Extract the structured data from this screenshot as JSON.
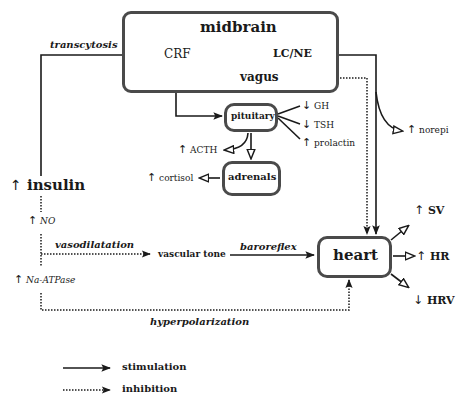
{
  "diagram": {
    "nodes": {
      "midbrain": "midbrain",
      "crf": "CRF",
      "lcne": "LC/NE",
      "vagus": "vagus",
      "pituitary": "pituitary",
      "adrenals": "adrenals",
      "heart": "heart",
      "insulin": "insulin",
      "vascular_tone": "vascular tone"
    },
    "outputs": {
      "gh": "GH",
      "tsh": "TSH",
      "prolactin": "prolactin",
      "acth": "ACTH",
      "cortisol": "cortisol",
      "norepi": "norepi",
      "sv": "SV",
      "hr": "HR",
      "hrv": "HRV",
      "no": "NO",
      "na_atpase": "Na-ATPase"
    },
    "arrows": {
      "up": "↑",
      "down": "↓"
    },
    "edge_labels": {
      "transcytosis": "transcytosis",
      "vasodilatation": "vasodilatation",
      "baroreflex": "baroreflex",
      "hyperpolarization": "hyperpolarization"
    },
    "legend": {
      "stimulation": "stimulation",
      "inhibition": "inhibition"
    }
  }
}
